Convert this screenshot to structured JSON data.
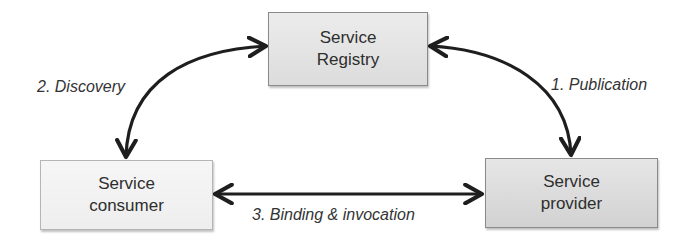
{
  "diagram": {
    "title": "",
    "nodes": [
      {
        "id": "registry",
        "line1": "Service",
        "line2": "Registry"
      },
      {
        "id": "consumer",
        "line1": "Service",
        "line2": "consumer"
      },
      {
        "id": "provider",
        "line1": "Service",
        "line2": "provider"
      }
    ],
    "edges": [
      {
        "from": "registry",
        "to": "provider",
        "label": "1. Publication",
        "direction": "bidirectional"
      },
      {
        "from": "registry",
        "to": "consumer",
        "label": "2. Discovery",
        "direction": "bidirectional"
      },
      {
        "from": "consumer",
        "to": "provider",
        "label": "3. Binding & invocation",
        "direction": "bidirectional"
      }
    ],
    "colors": {
      "arrow": "#1e1e1e",
      "box_border": "#8a8a8a",
      "registry_fill": "#e2e2e2",
      "consumer_fill": "#f2f2f2",
      "provider_fill": "#dcdcdc"
    }
  }
}
